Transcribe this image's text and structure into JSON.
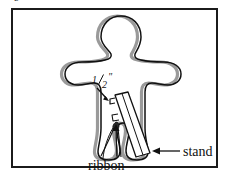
{
  "figure": {
    "clipped_top_label": "b",
    "frame": {
      "x": 11,
      "y": 8,
      "width": 207,
      "height": 160,
      "border_color": "#1b1b1b"
    },
    "background_color": "#ffffff",
    "outline_color": "#111111",
    "shadow_color": "#9a9a9a"
  },
  "annotations": [
    {
      "id": "measure",
      "name": "half-inch-dimension-label",
      "text": "1/2\"",
      "numerator": "1",
      "denominator": "2",
      "unit": "\"",
      "x": 92,
      "y": 83,
      "leader": "arrow pointing down-right to notch"
    },
    {
      "id": "ribbon",
      "name": "ribbon-label",
      "text": "ribbon",
      "x": 88,
      "y": 168,
      "leader": "two leader lines up to ribbon loop"
    },
    {
      "id": "stand",
      "name": "stand-label",
      "text": "stand",
      "x": 183,
      "y": 157,
      "leader": "left arrow to stand strip"
    }
  ],
  "parts": {
    "figure_body": "gingerbread-figure-outline",
    "stand_strip": "tilted-cardboard-stand",
    "notch": "slot-notch",
    "ribbon_loop": "ribbon-loop"
  }
}
